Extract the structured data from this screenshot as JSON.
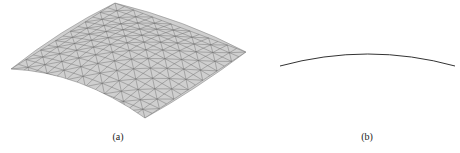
{
  "figure": {
    "panels": [
      {
        "id": "a",
        "caption": "(a)",
        "content": "triangulated curved surface mesh (3D view)"
      },
      {
        "id": "b",
        "caption": "(b)",
        "content": "curved arc (side profile)"
      }
    ]
  },
  "colors": {
    "mesh_fill": "#cfcfcf",
    "mesh_edge": "#6e6e6e",
    "curve": "#333333",
    "background": "#ffffff"
  }
}
